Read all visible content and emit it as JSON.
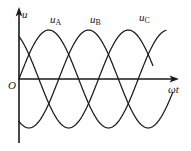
{
  "figure": {
    "background_color": "#fefefe",
    "line_color": "#1a1a1a"
  },
  "axes": {
    "y_axis_label": "u",
    "x_axis_label": "ωt",
    "origin_label": "O",
    "y_axis_x_px": 19,
    "x_axis_y_px": 79,
    "x_axis_end_px": 178,
    "y_axis_top_px": 10,
    "y_axis_bottom_px": 143
  },
  "curve_labels": {
    "a": {
      "base": "u",
      "sub": "A"
    },
    "b": {
      "base": "u",
      "sub": "B"
    },
    "c": {
      "base": "u",
      "sub": "C"
    }
  },
  "chart_data": {
    "type": "line",
    "title": "",
    "xlabel": "ωt",
    "ylabel": "u",
    "grid": false,
    "legend_position": "inline-above-peaks",
    "x_range_deg": [
      0,
      480
    ],
    "y_range": [
      -1,
      1
    ],
    "amplitude": 1,
    "period_deg": 360,
    "series": [
      {
        "name": "uA",
        "label": "u_A",
        "phase_deg": 0,
        "formula": "u = Um * sin(wt)",
        "samples_deg": [
          0,
          30,
          60,
          90,
          120,
          150,
          180,
          210,
          240,
          270,
          300,
          330,
          360,
          390,
          420,
          450,
          480
        ],
        "values": [
          0,
          0.5,
          0.87,
          1,
          0.87,
          0.5,
          0,
          -0.5,
          -0.87,
          -1,
          -0.87,
          -0.5,
          0,
          0.5,
          0.87,
          1,
          0.87
        ]
      },
      {
        "name": "uB",
        "label": "u_B",
        "phase_deg": -120,
        "formula": "u = Um * sin(wt - 120°)",
        "samples_deg": [
          0,
          30,
          60,
          90,
          120,
          150,
          180,
          210,
          240,
          270,
          300,
          330,
          360,
          390,
          420,
          450,
          480
        ],
        "values": [
          -0.87,
          -1,
          -0.87,
          -0.5,
          0,
          0.5,
          0.87,
          1,
          0.87,
          0.5,
          0,
          -0.5,
          -0.87,
          -1,
          -0.87,
          -0.5,
          0
        ]
      },
      {
        "name": "uC",
        "label": "u_C",
        "phase_deg": -240,
        "formula": "u = Um * sin(wt - 240°)",
        "samples_deg": [
          0,
          30,
          60,
          90,
          120,
          150,
          180,
          210,
          240,
          270,
          300,
          330,
          360,
          390,
          420,
          450,
          480
        ],
        "values": [
          0.87,
          0.5,
          0,
          -0.5,
          -0.87,
          -1,
          -0.87,
          -0.5,
          0,
          0.5,
          0.87,
          1,
          0.87,
          0.5,
          0,
          -0.5,
          -0.87
        ]
      }
    ]
  }
}
